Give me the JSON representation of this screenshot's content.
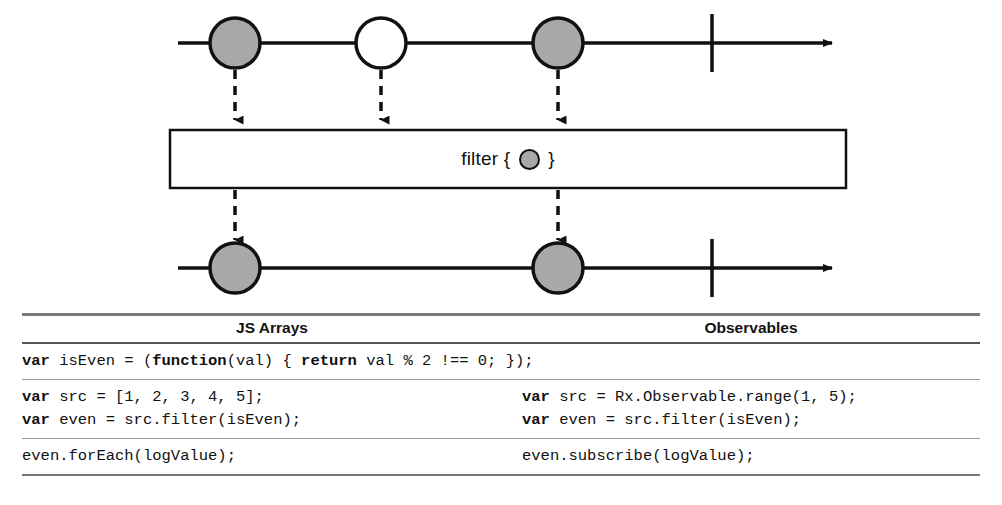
{
  "diagram": {
    "operator_box": {
      "label_prefix": "filter { ",
      "label_suffix": " }",
      "marble_icon": "gray-circle-icon"
    },
    "source_timeline": {
      "name": "source-observable-timeline",
      "marbles": [
        {
          "index": 1,
          "fill": "gray"
        },
        {
          "index": 2,
          "fill": "white"
        },
        {
          "index": 3,
          "fill": "gray"
        }
      ],
      "has_completion_bar": true,
      "has_arrow_head": true
    },
    "result_timeline": {
      "name": "result-observable-timeline",
      "marbles": [
        {
          "index": 1,
          "fill": "gray"
        },
        {
          "index": 2,
          "fill": "gray"
        }
      ],
      "has_completion_bar": true,
      "has_arrow_head": true
    },
    "colors": {
      "marble_gray": "#a8a8a8",
      "marble_white": "#ffffff",
      "stroke": "#111111"
    }
  },
  "table": {
    "headers": {
      "col1": "JS Arrays",
      "col2": "Observables"
    },
    "rows": [
      {
        "name": "shared-predicate-row",
        "span": true,
        "lines": [
          [
            {
              "t": "var",
              "b": true
            },
            {
              "t": " isEven = (",
              "b": false
            },
            {
              "t": "function",
              "b": true
            },
            {
              "t": "(val) { ",
              "b": false
            },
            {
              "t": "return",
              "b": true
            },
            {
              "t": " val % 2 !== 0; });",
              "b": false
            }
          ]
        ]
      },
      {
        "name": "source-and-filter-row",
        "span": false,
        "col1_lines": [
          [
            {
              "t": "var",
              "b": true
            },
            {
              "t": " src = [1, 2, 3, 4, 5];",
              "b": false
            }
          ],
          [
            {
              "t": "var",
              "b": true
            },
            {
              "t": " even = src.filter(isEven);",
              "b": false
            }
          ]
        ],
        "col2_lines": [
          [
            {
              "t": "var",
              "b": true
            },
            {
              "t": " src = Rx.Observable.range(1, 5);",
              "b": false
            }
          ],
          [
            {
              "t": "var",
              "b": true
            },
            {
              "t": " even = src.filter(isEven);",
              "b": false
            }
          ]
        ]
      },
      {
        "name": "consume-row",
        "span": false,
        "col1_lines": [
          [
            {
              "t": "even.forEach(logValue);",
              "b": false
            }
          ]
        ],
        "col2_lines": [
          [
            {
              "t": "even.subscribe(logValue);",
              "b": false
            }
          ]
        ]
      }
    ]
  }
}
